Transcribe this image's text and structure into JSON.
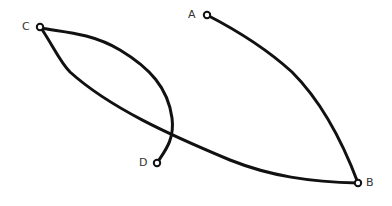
{
  "diagram": {
    "nodes": [
      {
        "id": "A",
        "label": "A"
      },
      {
        "id": "B",
        "label": "B"
      },
      {
        "id": "C",
        "label": "C"
      },
      {
        "id": "D",
        "label": "D"
      }
    ],
    "edges": [
      {
        "from": "A",
        "to": "B"
      },
      {
        "from": "C",
        "to": "B"
      },
      {
        "from": "C",
        "to": "D"
      }
    ],
    "colors": {
      "stroke": "#111111",
      "label": "#333333",
      "background": "#ffffff"
    }
  }
}
